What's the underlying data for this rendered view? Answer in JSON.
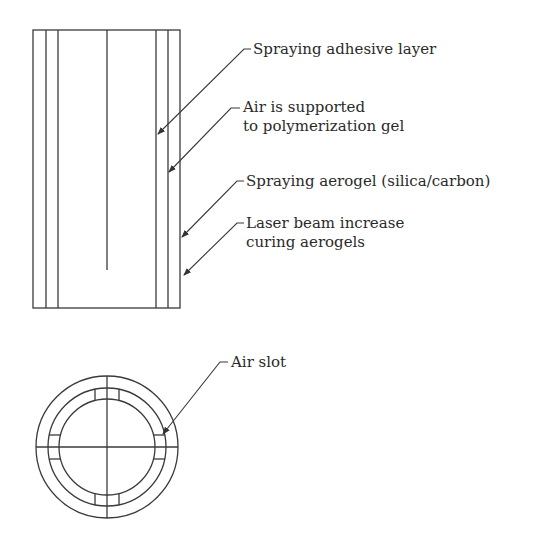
{
  "figure": {
    "stroke_color": "#3a3a3a",
    "background": "#ffffff",
    "side_view": {
      "name": "cylinder side view",
      "labels": [
        {
          "lines": [
            "Spraying adhesive layer"
          ]
        },
        {
          "lines": [
            "Air is supported",
            "to polymerization gel"
          ]
        },
        {
          "lines": [
            "Spraying aerogel (silica/carbon)"
          ]
        },
        {
          "lines": [
            "Laser beam increase",
            "curing aerogels"
          ]
        }
      ]
    },
    "cross_section": {
      "name": "cylinder cross section",
      "labels": [
        {
          "lines": [
            "Air slot"
          ]
        }
      ]
    }
  }
}
